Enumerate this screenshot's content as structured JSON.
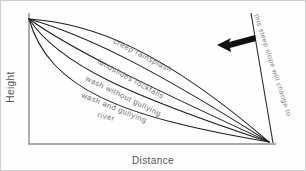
{
  "figure": {
    "background_color": "#fefefe",
    "border_color": "#cfcfcf",
    "curve_color": "#1d1d1d",
    "axis_color": "#8d8d8d",
    "label_color": "#6e6e6e",
    "arrow_color": "#111111"
  },
  "chart_data": {
    "type": "line",
    "title": "",
    "xlabel": "Distance",
    "ylabel": "Height",
    "grid": false,
    "legend": "inline-along-curves",
    "xlim": [
      0,
      1
    ],
    "ylim": [
      0,
      1
    ],
    "origin_point": [
      0,
      1
    ],
    "convergence_point": [
      1,
      0
    ],
    "series": [
      {
        "name": "creep  rainsplash",
        "label": "creep  rainsplash",
        "shape": "convex",
        "path": "M 28 18 C 90 22 160 48 268 141",
        "label_x": 112,
        "label_y": 42,
        "label_rotate": 27
      },
      {
        "name": "landslides  rockfalls",
        "label": "landslides  rockfalls",
        "shape": "straight-slightly-convex",
        "path": "M 28 18 C 84 34 150 66 268 141",
        "label_x": 96,
        "label_y": 62,
        "label_rotate": 29
      },
      {
        "name": "wash without gullying",
        "label": "wash without gullying",
        "shape": "concave",
        "path": "M 28 18 C 70 48 140 82 268 141",
        "label_x": 84,
        "label_y": 79,
        "label_rotate": 26
      },
      {
        "name": "wash and gullying",
        "label": "wash and gullying",
        "shape": "more-concave",
        "path": "M 28 18 C 58 64 130 95 268 141",
        "label_x": 80,
        "label_y": 96,
        "label_rotate": 22
      },
      {
        "name": "river",
        "label": "river",
        "shape": "most-concave",
        "path": "M 28 18 C 48 88 120 116 268 141",
        "label_x": 96,
        "label_y": 116,
        "label_rotate": 14
      }
    ],
    "annotations": [
      {
        "name": "steep-slope-note",
        "text": "this steep slope will change to",
        "x": 253,
        "y": 14,
        "rotate": 72
      },
      {
        "name": "direction-arrow",
        "text": "",
        "points_toward": "left"
      }
    ]
  },
  "axes": {
    "x_label": "Distance",
    "y_label": "Height"
  }
}
